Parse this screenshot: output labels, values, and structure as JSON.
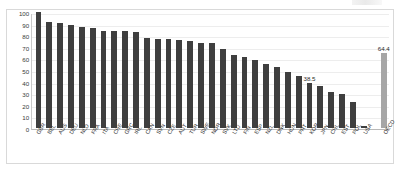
{
  "chart_data": {
    "type": "bar",
    "title": "",
    "subtitle": "",
    "xlabel": "",
    "ylabel": "",
    "ylim": [
      0,
      100
    ],
    "yticks": [
      100,
      90,
      80,
      70,
      60,
      50,
      40,
      30,
      20,
      10,
      0
    ],
    "grid": true,
    "legend": "none",
    "categories": [
      "GBR",
      "BEL",
      "AUS",
      "DEU",
      "NLD",
      "FRA",
      "ITA",
      "CHE",
      "GRC",
      "IRL",
      "CAN",
      "SVN",
      "CZE",
      "AUT",
      "TUR",
      "SWE",
      "NOR",
      "SVK",
      "LTU",
      "FIN",
      "ESP",
      "NZL",
      "DNK",
      "HUN",
      "PRT",
      "KOR",
      "JPN",
      "CHL",
      "EST",
      "POL",
      "USA",
      "OECD"
    ],
    "values": [
      100.0,
      91.0,
      90.5,
      89.0,
      87.5,
      86.5,
      84.0,
      84.0,
      83.5,
      83.0,
      78.0,
      77.0,
      76.5,
      76.0,
      75.0,
      73.5,
      73.0,
      68.0,
      63.0,
      61.5,
      58.5,
      55.5,
      53.0,
      48.0,
      45.0,
      38.5,
      36.0,
      31.0,
      29.5,
      22.0,
      1.5,
      64.4
    ],
    "data_labels": {
      "KOR": "38.5",
      "OECD": "64.4"
    },
    "series_colors": {
      "country_bar": "#3f3f3f",
      "oecd_bar": "#a6a6a6"
    },
    "highlight_category": "OECD",
    "separator_before": "OECD"
  }
}
